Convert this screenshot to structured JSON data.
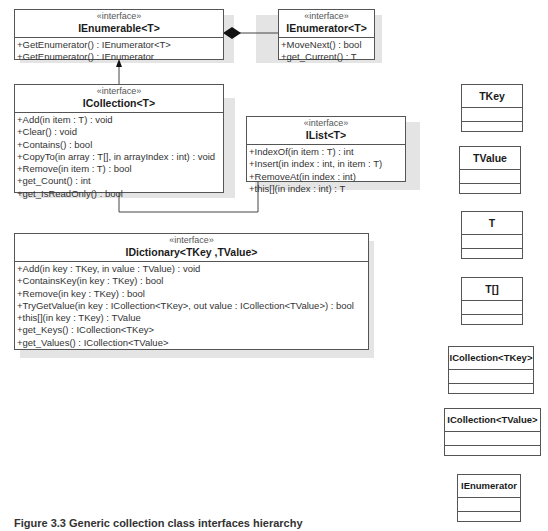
{
  "diagram": {
    "stereotype": "«interface»",
    "interfaces": [
      {
        "id": "ienumerable_t",
        "name": "IEnumerable<T>",
        "operations": [
          "+GetEnumerator() : IEnumerator<T>",
          "+GetEnumerator() : IEnumerator"
        ]
      },
      {
        "id": "ienumerator_t",
        "name": "IEnumerator<T>",
        "operations": [
          "+MoveNext() : bool",
          "+get_Current() : T"
        ]
      },
      {
        "id": "icollection_t",
        "name": "ICollection<T>",
        "operations": [
          "+Add(in item : T) : void",
          "+Clear() : void",
          "+Contains() : bool",
          "+CopyTo(in array : T[], in arrayIndex : int) : void",
          "+Remove(in item : T) : bool",
          "+get_Count() : int",
          "+get_IsReadOnly() : bool"
        ]
      },
      {
        "id": "ilist_t",
        "name": "IList<T>",
        "operations": [
          "+IndexOf(in item : T) : int",
          "+Insert(in index : int, in item : T)",
          "+RemoveAt(in index : int)",
          "+this[](in index : int) : T"
        ]
      },
      {
        "id": "idictionary",
        "name": "IDictionary<TKey ,TValue>",
        "operations": [
          "+Add(in key : TKey, in value : TValue) : void",
          "+ContainsKey(in key : TKey) : bool",
          "+Remove(in key : TKey) : bool",
          "+TryGetValue(in key : ICollection<TKey>, out value : ICollection<TValue>) : bool",
          "+this[](in key : TKey) : TValue",
          "+get_Keys() : ICollection<TKey>",
          "+get_Values() : ICollection<TValue>"
        ]
      }
    ],
    "classes": [
      {
        "id": "tkey",
        "name": "TKey"
      },
      {
        "id": "tvalue",
        "name": "TValue"
      },
      {
        "id": "t",
        "name": "T"
      },
      {
        "id": "tarray",
        "name": "T[]"
      },
      {
        "id": "icollection_tkey",
        "name": "ICollection<TKey>"
      },
      {
        "id": "icollection_tvalue",
        "name": "ICollection<TValue>"
      },
      {
        "id": "ienumerator",
        "name": "IEnumerator"
      }
    ],
    "relationships": [
      {
        "from": "IEnumerable<T>",
        "to": "IEnumerator<T>",
        "type": "composition"
      },
      {
        "from": "ICollection<T>",
        "to": "IEnumerable<T>",
        "type": "generalization"
      },
      {
        "from": "IList<T>",
        "to": "ICollection<T>",
        "type": "generalization"
      }
    ]
  },
  "caption": "Figure 3.3 Generic collection class interfaces hierarchy"
}
